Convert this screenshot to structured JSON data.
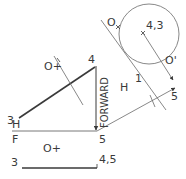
{
  "diagram": {
    "colors": {
      "line": "#3a3a3a",
      "thin": "#6a6a6a",
      "background": "#ffffff"
    },
    "labels": {
      "point_4_3": "4,3",
      "point_o_top": "O",
      "point_o_prime": "O'",
      "point_5_right": "5",
      "fold_h_aux": "H",
      "fold_1_aux": "1",
      "point_4_top": "4",
      "point_3_top": "3",
      "point_o_plus_top": "O+",
      "forward": "FORWARD",
      "fold_h": "H",
      "fold_f": "F",
      "point_5_fold": "5",
      "point_o_plus_front": "O+",
      "point_3_front": "3",
      "point_4_5_front": "4,5"
    }
  }
}
